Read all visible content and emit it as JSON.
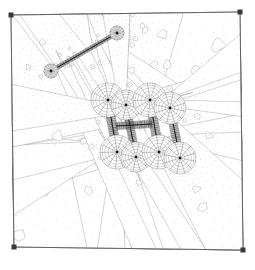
{
  "figure": {
    "kind": "finite-element-mesh",
    "title": "",
    "background_color": "#ffffff",
    "line_color": "#6f6f6f",
    "dense_line_color": "#2a2a2a",
    "node_color": "#9a9a9a",
    "corner_marker_color": "#3a3a3a",
    "canvas": {
      "width": 255,
      "height": 270
    }
  },
  "domain": {
    "name": "square-plate-domain",
    "corners": [
      {
        "label": "top-left",
        "x": 11,
        "y": 15
      },
      {
        "label": "top-right",
        "x": 240,
        "y": 12
      },
      {
        "label": "bottom-right",
        "x": 243,
        "y": 250
      },
      {
        "label": "bottom-left",
        "x": 14,
        "y": 247
      }
    ],
    "corner_marker_size": 5,
    "boundary_layer_rings": 1,
    "background_cell_size": 11
  },
  "mesh": {
    "type": "polygonal-voronoi",
    "background_cell_count_x": 21,
    "background_cell_count_y": 21,
    "refinement_levels": 4,
    "show_cell_centers": true
  },
  "chart_data": {
    "type": "scatter",
    "title": "",
    "xlabel": "",
    "ylabel": "",
    "grid": false,
    "legend": null,
    "xlim": [
      0,
      255
    ],
    "ylim": [
      0,
      270
    ],
    "features": [
      {
        "name": "isolated-crack",
        "kind": "thin-inclusion",
        "start": {
          "x": 51,
          "y": 71
        },
        "end": {
          "x": 117,
          "y": 33
        },
        "layer_count": 26,
        "half_width": 2.1,
        "tip_fan_radius": 7,
        "tip_fan_wedges": 14
      },
      {
        "name": "crack-network-segment-1",
        "kind": "thin-inclusion",
        "start": {
          "x": 108,
          "y": 100
        },
        "end": {
          "x": 117,
          "y": 152
        },
        "layer_count": 30,
        "half_width": 4.5,
        "tip_fan_radius": 17,
        "tip_fan_wedges": 13
      },
      {
        "name": "crack-network-segment-2",
        "kind": "thin-inclusion",
        "start": {
          "x": 126,
          "y": 105
        },
        "end": {
          "x": 136,
          "y": 157
        },
        "layer_count": 28,
        "half_width": 4.0,
        "tip_fan_radius": 15,
        "tip_fan_wedges": 12
      },
      {
        "name": "crack-network-segment-3",
        "kind": "thin-inclusion",
        "start": {
          "x": 150,
          "y": 100
        },
        "end": {
          "x": 159,
          "y": 152
        },
        "layer_count": 30,
        "half_width": 4.5,
        "tip_fan_radius": 17,
        "tip_fan_wedges": 13
      },
      {
        "name": "crack-network-segment-4",
        "kind": "thin-inclusion",
        "start": {
          "x": 170,
          "y": 108
        },
        "end": {
          "x": 180,
          "y": 158
        },
        "layer_count": 28,
        "half_width": 4.2,
        "tip_fan_radius": 16,
        "tip_fan_wedges": 12
      },
      {
        "name": "crack-network-bridge",
        "kind": "thin-inclusion",
        "start": {
          "x": 116,
          "y": 126
        },
        "end": {
          "x": 152,
          "y": 124
        },
        "layer_count": 20,
        "half_width": 3.6,
        "tip_fan_radius": 0,
        "tip_fan_wedges": 0
      }
    ],
    "vertex_nodes": [
      {
        "x": 51,
        "y": 71
      },
      {
        "x": 117,
        "y": 33
      },
      {
        "x": 108,
        "y": 100
      },
      {
        "x": 117,
        "y": 152
      },
      {
        "x": 150,
        "y": 100
      },
      {
        "x": 159,
        "y": 152
      },
      {
        "x": 170,
        "y": 108
      },
      {
        "x": 180,
        "y": 158
      },
      {
        "x": 126,
        "y": 105
      },
      {
        "x": 136,
        "y": 157
      }
    ]
  }
}
